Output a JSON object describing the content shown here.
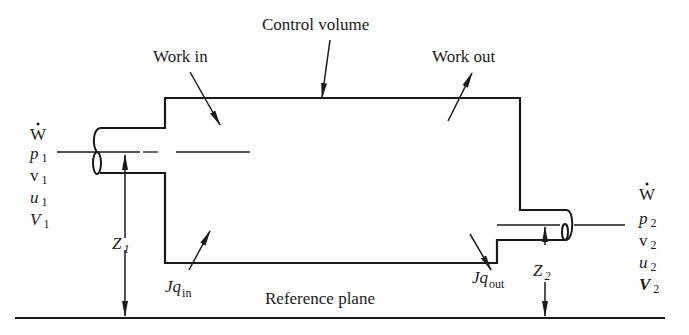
{
  "diagram": {
    "labels": {
      "control_volume": "Control volume",
      "work_in": "Work in",
      "work_out": "Work out",
      "reference_plane": "Reference plane"
    },
    "inlet": {
      "w_dot": "W",
      "p": "p",
      "v": "v",
      "u": "u",
      "V": "V",
      "subscript": "1",
      "height_label": "Z",
      "height_sub": "1",
      "heat_label": "Jq",
      "heat_sub": "in"
    },
    "outlet": {
      "w_dot": "W",
      "p": "p",
      "v": "v",
      "u": "u",
      "V": "V",
      "subscript": "2",
      "height_label": "Z",
      "height_sub": "2",
      "heat_label": "Jq",
      "heat_sub": "out"
    },
    "colors": {
      "ink": "#1a1a1a",
      "background": "#ffffff"
    }
  }
}
